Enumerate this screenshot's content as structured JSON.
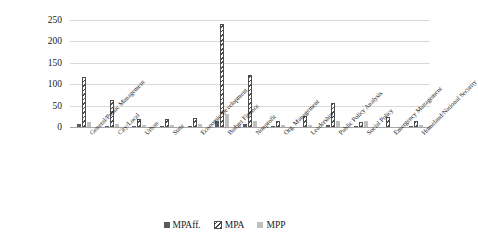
{
  "chart_data": {
    "type": "bar",
    "title": "",
    "subtitle": "",
    "xlabel": "",
    "ylabel": "",
    "ylim": [
      0,
      250
    ],
    "yticks": [
      0,
      50,
      100,
      150,
      200,
      250
    ],
    "grid": true,
    "legend_position": "bottom",
    "categories": [
      "General/Public Management",
      "City/Local",
      "Urban",
      "State",
      "Economic Development",
      "Budget Finance",
      "Nonprofit",
      "Org. Management",
      "Leadership",
      "Public Policy Analysis",
      "Social Policy",
      "Emergency Management",
      "Homeland/National Security"
    ],
    "series": [
      {
        "name": "MPAff.",
        "color": "#595959",
        "pattern": "solid",
        "values": [
          8,
          3,
          1,
          1,
          2,
          15,
          7,
          1,
          0,
          4,
          2,
          0,
          1
        ]
      },
      {
        "name": "MPA",
        "color": "#4d4d4d",
        "pattern": "diagonal-hatch",
        "values": [
          117,
          63,
          19,
          18,
          22,
          240,
          121,
          13,
          26,
          55,
          11,
          24,
          14
        ]
      },
      {
        "name": "MPP",
        "color": "#bfbfbf",
        "pattern": "solid",
        "values": [
          11,
          8,
          5,
          5,
          8,
          31,
          13,
          5,
          5,
          15,
          15,
          0,
          5
        ]
      }
    ]
  },
  "legend": {
    "items": [
      {
        "label": "MPAff."
      },
      {
        "label": "MPA"
      },
      {
        "label": "MPP"
      }
    ]
  }
}
